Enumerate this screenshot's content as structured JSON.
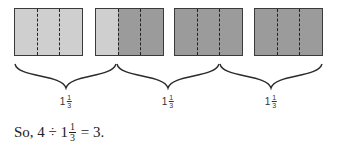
{
  "colors": {
    "shaded_light": "#cfcfcf",
    "shaded_dark": "#9b9b9b",
    "outline": "#3a3a3a"
  },
  "boxes": [
    {
      "left": 14,
      "parts": [
        "light",
        "light",
        "light"
      ]
    },
    {
      "left": 95,
      "parts": [
        "light",
        "dark",
        "dark"
      ]
    },
    {
      "left": 174,
      "parts": [
        "dark",
        "dark",
        "dark"
      ]
    },
    {
      "left": 254,
      "parts": [
        "dark",
        "dark",
        "dark"
      ]
    }
  ],
  "groups": [
    {
      "whole": "1",
      "numerator": "1",
      "denominator": "3",
      "center_x": 66
    },
    {
      "whole": "1",
      "numerator": "1",
      "denominator": "3",
      "center_x": 168
    },
    {
      "whole": "1",
      "numerator": "1",
      "denominator": "3",
      "center_x": 271
    }
  ],
  "conclusion": {
    "prefix": "So, 4 ÷ 1",
    "numerator": "1",
    "denominator": "3",
    "suffix": " = 3."
  }
}
